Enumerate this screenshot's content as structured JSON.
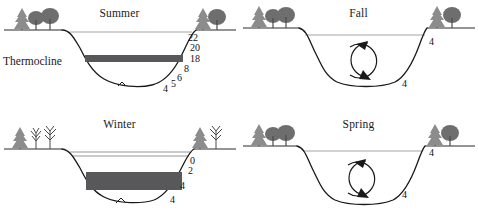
{
  "figure": {
    "caption_present": false,
    "colors": {
      "ink": "#1a1a1a",
      "thermocline_band": "#58585a",
      "water_surface_line": "#9a9a9a",
      "tree_foliage": "#6e6e6e",
      "tree_trunk": "#4a4a4a",
      "ground_line": "#2a2a2a"
    }
  },
  "panels": [
    {
      "id": "summer",
      "title": "Summer",
      "thermocline_label": "Thermocline",
      "has_thermocline_band": true,
      "has_ice_layer": false,
      "has_circulation_arrows": false,
      "tree_type": "leafy",
      "depth_labels": [
        {
          "value": "22",
          "x": 188,
          "y": 32
        },
        {
          "value": "20",
          "x": 190,
          "y": 42
        },
        {
          "value": "18",
          "x": 190,
          "y": 53
        },
        {
          "value": "8",
          "x": 184,
          "y": 63
        },
        {
          "value": "6",
          "x": 177,
          "y": 72
        },
        {
          "value": "5",
          "x": 171,
          "y": 78
        },
        {
          "value": "4",
          "x": 163,
          "y": 83
        }
      ]
    },
    {
      "id": "fall",
      "title": "Fall",
      "thermocline_label": "",
      "has_thermocline_band": false,
      "has_ice_layer": false,
      "has_circulation_arrows": true,
      "tree_type": "leafy",
      "depth_labels": [
        {
          "value": "4",
          "x": 190,
          "y": 36
        },
        {
          "value": "4",
          "x": 163,
          "y": 78
        }
      ]
    },
    {
      "id": "winter",
      "title": "Winter",
      "thermocline_label": "",
      "has_thermocline_band": true,
      "has_ice_layer": true,
      "has_circulation_arrows": false,
      "tree_type": "bare",
      "depth_labels": [
        {
          "value": "0",
          "x": 190,
          "y": 44
        },
        {
          "value": "2",
          "x": 188,
          "y": 54
        },
        {
          "value": "4",
          "x": 180,
          "y": 69
        },
        {
          "value": "4",
          "x": 170,
          "y": 83
        }
      ]
    },
    {
      "id": "spring",
      "title": "Spring",
      "thermocline_label": "",
      "has_thermocline_band": false,
      "has_ice_layer": false,
      "has_circulation_arrows": true,
      "tree_type": "leafy",
      "depth_labels": [
        {
          "value": "4",
          "x": 190,
          "y": 36
        },
        {
          "value": "4",
          "x": 163,
          "y": 78
        }
      ]
    }
  ]
}
